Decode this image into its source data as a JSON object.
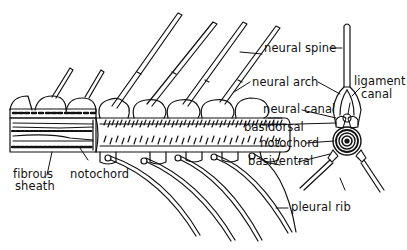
{
  "diagram": {
    "labels": {
      "neural_spine": "neural spine",
      "neural_arch": "neural arch",
      "ligament_canal_line1": "ligament",
      "ligament_canal_line2": "canal",
      "neural_canal": "neural canal",
      "basidorsal": "basidorsal",
      "notochord_right": "notochord",
      "basiventral": "basiventral",
      "pleural_rib": "pleural rib",
      "fibrous_sheath_line1": "fibrous",
      "fibrous_sheath_line2": "sheath",
      "notochord_left": "notochord"
    },
    "colors": {
      "ink": "#111111",
      "background": "#ffffff"
    }
  }
}
